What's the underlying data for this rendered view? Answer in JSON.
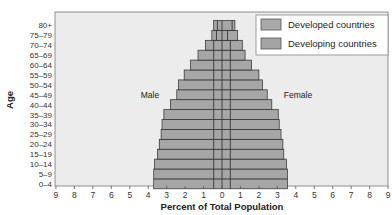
{
  "chart_data": {
    "type": "bar",
    "subtype": "population-pyramid",
    "title": "",
    "xlabel": "Percent of Total Population",
    "ylabel": "Age",
    "x_ticks": [
      "9",
      "8",
      "7",
      "6",
      "5",
      "4",
      "3",
      "2",
      "1",
      "0",
      "1",
      "2",
      "3",
      "4",
      "5",
      "6",
      "7",
      "8",
      "9"
    ],
    "xlim": [
      -9,
      9
    ],
    "categories": [
      "0–4",
      "5–9",
      "10–14",
      "15–19",
      "20–24",
      "25–29",
      "30–34",
      "35–39",
      "40–44",
      "45–49",
      "50–54",
      "55–59",
      "60–64",
      "65–69",
      "70–74",
      "75–79",
      "80+"
    ],
    "side_labels": {
      "left": "Male",
      "right": "Female"
    },
    "series": [
      {
        "name": "Developing countries",
        "side": "male",
        "values": [
          3.7,
          3.7,
          3.65,
          3.5,
          3.4,
          3.3,
          3.25,
          3.15,
          2.8,
          2.45,
          2.35,
          2.05,
          1.7,
          1.3,
          0.9,
          0.55,
          0.45
        ]
      },
      {
        "name": "Developing countries",
        "side": "female",
        "values": [
          3.55,
          3.55,
          3.5,
          3.35,
          3.3,
          3.2,
          3.1,
          3.05,
          2.7,
          2.45,
          2.2,
          2.0,
          1.6,
          1.25,
          1.1,
          0.85,
          0.7
        ]
      },
      {
        "name": "Developed countries",
        "side": "male",
        "values": [
          0.45,
          0.45,
          0.45,
          0.45,
          0.45,
          0.45,
          0.45,
          0.45,
          0.45,
          0.45,
          0.45,
          0.45,
          0.45,
          0.45,
          0.45,
          0.3,
          0.25
        ]
      },
      {
        "name": "Developed countries",
        "side": "female",
        "values": [
          0.45,
          0.45,
          0.45,
          0.45,
          0.45,
          0.45,
          0.45,
          0.45,
          0.45,
          0.45,
          0.45,
          0.45,
          0.45,
          0.45,
          0.45,
          0.3,
          0.55
        ]
      }
    ],
    "legend": {
      "position": "top-right",
      "entries": [
        {
          "label": "Developed countries",
          "color": "#a9a9a9"
        },
        {
          "label": "Developing countries",
          "color": "#a4a4a4"
        }
      ]
    },
    "colors": {
      "bar": "#a6a6a6",
      "bar_edge": "#2a2a2a",
      "plot_bg": "#ececec",
      "axis": "#555555"
    },
    "grid": false
  }
}
